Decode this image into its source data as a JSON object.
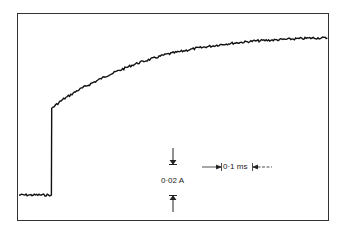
{
  "chart_data": {
    "type": "line",
    "title": "",
    "xlabel": "",
    "ylabel": "",
    "grid": false,
    "scale_bars": {
      "vertical": {
        "label": "0·02 A",
        "value": 0.02,
        "unit": "A"
      },
      "horizontal": {
        "label": "0·1 ms",
        "value": 0.1,
        "unit": "ms"
      }
    },
    "x_ms": [
      0,
      0.11,
      0.111,
      0.15,
      0.2,
      0.3,
      0.4,
      0.5,
      0.6,
      0.7,
      0.8,
      0.9,
      1.0,
      1.05
    ],
    "y_A": [
      0,
      0,
      0.058,
      0.064,
      0.07,
      0.08,
      0.088,
      0.094,
      0.098,
      0.101,
      0.103,
      0.104,
      0.105,
      0.105
    ]
  },
  "labels": {
    "current_scale": "0·02 A",
    "time_scale": "0·1 ms"
  }
}
